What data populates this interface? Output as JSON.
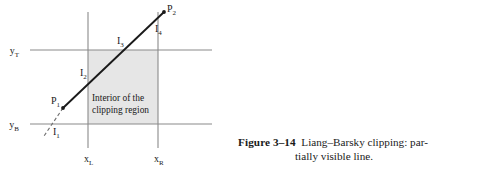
{
  "figure": {
    "caption_label": "Figure 3–14",
    "caption_text": "Liang–Barsky clipping: par-",
    "caption_text_line2": "tially visible line.",
    "colors": {
      "line": "#1a1a1a",
      "axis": "#808080",
      "shade": "#e6e6e6",
      "text": "#1a1a1a"
    },
    "labels": {
      "y_top": "y",
      "y_top_sub": "T",
      "y_bottom": "y",
      "y_bottom_sub": "B",
      "x_left": "x",
      "x_left_sub": "L",
      "x_right": "x",
      "x_right_sub": "R",
      "p1": "P",
      "p1_sub": "1",
      "p2": "P",
      "p2_sub": "2",
      "i1": "I",
      "i1_sub": "1",
      "i2": "I",
      "i2_sub": "2",
      "i3": "I",
      "i3_sub": "3",
      "i4": "I",
      "i4_sub": "4",
      "interior_line1": "Interior of the",
      "interior_line2": "clipping region"
    },
    "geometry": {
      "x_left": 88,
      "x_right": 158,
      "y_top": 50,
      "y_bottom": 124,
      "p1_x": 63,
      "p1_y": 108,
      "p2_x": 164,
      "p2_y": 12
    }
  }
}
